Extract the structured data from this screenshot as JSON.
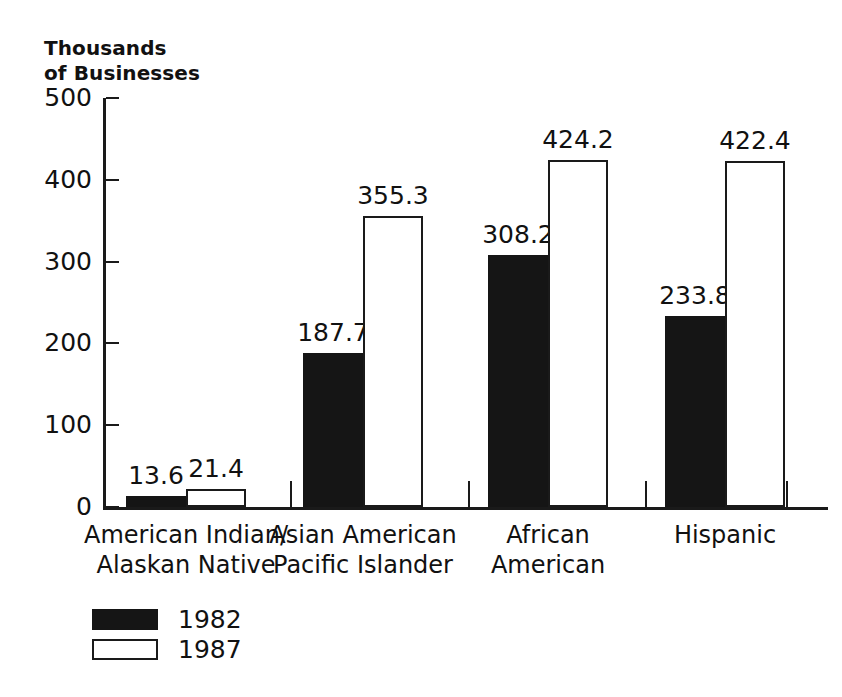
{
  "chart_data": {
    "type": "bar",
    "title": "Thousands\nof Businesses",
    "title_line1": "Thousands",
    "title_line2": "of Businesses",
    "xlabel": "",
    "ylabel": "Thousands of Businesses",
    "ylim": [
      0,
      500
    ],
    "yticks": [
      0,
      100,
      200,
      300,
      400,
      500
    ],
    "ytick_labels": [
      "0",
      "100",
      "200",
      "300",
      "400",
      "500"
    ],
    "grid": false,
    "legend_position": "bottom-left",
    "categories": [
      "American Indian/\nAlaskan Native",
      "Asian American\nPacific Islander",
      "African\nAmerican",
      "Hispanic"
    ],
    "series": [
      {
        "name": "1982",
        "color": "#151515",
        "fill": "solid",
        "values": [
          13.6,
          187.7,
          308.2,
          233.8
        ],
        "value_labels": [
          "13.6",
          "187.7",
          "308.2",
          "233.8"
        ]
      },
      {
        "name": "1987",
        "color": "#ffffff",
        "fill": "outline",
        "values": [
          21.4,
          355.3,
          424.2,
          422.4
        ],
        "value_labels": [
          "21.4",
          "355.3",
          "424.2",
          "422.4"
        ]
      }
    ]
  },
  "legend": {
    "items": [
      {
        "label": "1982",
        "style": "dark"
      },
      {
        "label": "1987",
        "style": "light"
      }
    ]
  },
  "colors": {
    "background": "#ffffff",
    "axis": "#1a1a1a",
    "text": "#111111",
    "bar_1982": "#151515",
    "bar_1987": "#ffffff"
  }
}
